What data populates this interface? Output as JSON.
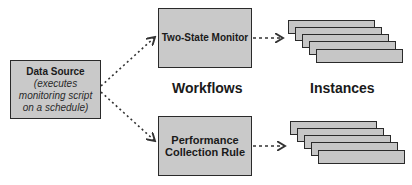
{
  "diagram": {
    "data_source": {
      "title": "Data Source",
      "subtitle_lines": [
        "(executes",
        "monitoring script",
        "on a schedule)"
      ]
    },
    "workflows": [
      {
        "title_lines": [
          "Two-State Monitor"
        ]
      },
      {
        "title_lines": [
          "Performance",
          "Collection Rule"
        ]
      }
    ],
    "labels": {
      "workflows": "Workflows",
      "instances": "Instances"
    },
    "instance_stacks": [
      {
        "count": 5
      },
      {
        "count": 5
      }
    ],
    "colors": {
      "box_fill": "#c9c9c9",
      "border": "#2a2a2a",
      "arrow": "#333333"
    }
  }
}
